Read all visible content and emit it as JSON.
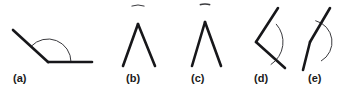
{
  "sheet": {
    "width": 344,
    "height": 95,
    "background": "#ffffff",
    "ray_color": "#17171a",
    "arc_color": "#3a3a3e",
    "label_color": "#1a1a1a",
    "ray_stroke_width": 2.6,
    "arc_stroke_width": 1.0
  },
  "labels": {
    "a": "(a)",
    "b": "(b)",
    "c": "(c)",
    "d": "(d)",
    "e": "(e)"
  },
  "figures": [
    {
      "id": "figure-a",
      "label": "(a)",
      "description": "obtuse angle, vertex at lower left, one horizontal ray to the right and one ray up to the left, with a single arc marking the interior angle",
      "vertex": [
        48,
        62
      ],
      "rays": [
        {
          "name": "horizontal-right-ray",
          "from": [
            48,
            62
          ],
          "to": [
            92,
            62
          ]
        },
        {
          "name": "upper-left-ray",
          "from": [
            48,
            62
          ],
          "to": [
            13,
            30
          ]
        }
      ],
      "arc": {
        "name": "interior-angle-arc",
        "type": "single",
        "radius": 23,
        "start_deg": 0,
        "end_deg": 137
      }
    },
    {
      "id": "figure-b",
      "label": "(b)",
      "description": "narrow inverted V with apex up, marked by a nearly complete circular arc showing the reflex angle around the apex",
      "vertex": [
        138,
        24
      ],
      "rays": [
        {
          "name": "left-ray",
          "from": [
            138,
            24
          ],
          "to": [
            123,
            66
          ]
        },
        {
          "name": "right-ray",
          "from": [
            138,
            24
          ],
          "to": [
            155,
            66
          ]
        }
      ],
      "arc": {
        "name": "reflex-angle-arc",
        "type": "reflex",
        "radius": 19,
        "start_deg": 70,
        "end_deg": 110
      }
    },
    {
      "id": "figure-c",
      "label": "(c)",
      "description": "inverted V with apex up, marked by a short arc crossing the two rays close to the apex, like the letter A",
      "vertex": [
        205,
        22
      ],
      "rays": [
        {
          "name": "left-ray",
          "from": [
            205,
            22
          ],
          "to": [
            192,
            66
          ]
        },
        {
          "name": "right-ray",
          "from": [
            205,
            22
          ],
          "to": [
            221,
            66
          ]
        }
      ],
      "arc": {
        "name": "interior-angle-arc",
        "type": "single",
        "radius": 18,
        "start_deg": 73,
        "end_deg": 107
      }
    },
    {
      "id": "figure-d",
      "label": "(d)",
      "description": "bent line with vertex pointing left, arc bulging to the right marking the interior angle between the upper and lower rays",
      "vertex": [
        256,
        42
      ],
      "rays": [
        {
          "name": "upper-ray",
          "from": [
            256,
            42
          ],
          "to": [
            278,
            8
          ]
        },
        {
          "name": "lower-ray",
          "from": [
            256,
            42
          ],
          "to": [
            285,
            68
          ]
        }
      ],
      "arc": {
        "name": "interior-angle-arc",
        "type": "single",
        "radius": 27,
        "start_deg": 303,
        "end_deg": 42
      }
    },
    {
      "id": "figure-e",
      "label": "(e)",
      "description": "bent line with vertex pointing left, large reflex arc sweeping around to the right of the vertex",
      "vertex": [
        310,
        42
      ],
      "rays": [
        {
          "name": "upper-ray",
          "from": [
            310,
            42
          ],
          "to": [
            330,
            8
          ]
        },
        {
          "name": "lower-ray",
          "from": [
            310,
            42
          ],
          "to": [
            303,
            70
          ]
        }
      ],
      "arc": {
        "name": "reflex-angle-arc",
        "type": "reflex",
        "radius": 22,
        "start_deg": 300,
        "end_deg": 76
      }
    }
  ]
}
